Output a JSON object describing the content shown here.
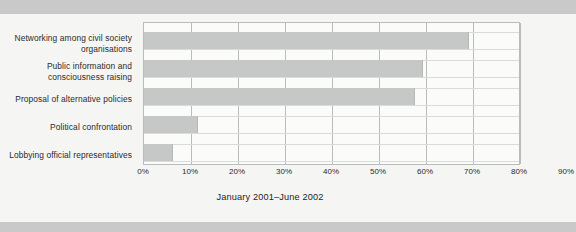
{
  "caption": "January 2001–June 2002",
  "accent_color": "#c6c8c8",
  "frame_color": "#b9bcbc",
  "axis": {
    "ticks": [
      "0%",
      "10%",
      "20%",
      "30%",
      "40%",
      "50%",
      "60%",
      "70%",
      "80%",
      "90%"
    ]
  },
  "categories": [
    "Networking among civil society organisations",
    "Public information and consciousness raising",
    "Proposal of alternative policies",
    "Political confrontation",
    "Lobbying official representatives"
  ],
  "chart_data": {
    "type": "bar",
    "orientation": "horizontal",
    "title": "",
    "subtitle": "",
    "xlabel": "",
    "ylabel": "",
    "categories": [
      "Networking among civil society organisations",
      "Public information and consciousness raising",
      "Proposal of alternative policies",
      "Political confrontation",
      "Lobbying official representatives"
    ],
    "values": [
      78,
      67,
      65,
      13,
      7
    ],
    "xlim": [
      0,
      90
    ],
    "xticks": [
      0,
      10,
      20,
      30,
      40,
      50,
      60,
      70,
      80,
      90
    ],
    "xtick_labels": [
      "0%",
      "10%",
      "20%",
      "30%",
      "40%",
      "50%",
      "60%",
      "70%",
      "80%",
      "90%"
    ],
    "unit": "%",
    "grid": "vertical",
    "legend": "none",
    "bar_color": "#c6c8c8",
    "annotation": "January 2001–June 2002"
  }
}
